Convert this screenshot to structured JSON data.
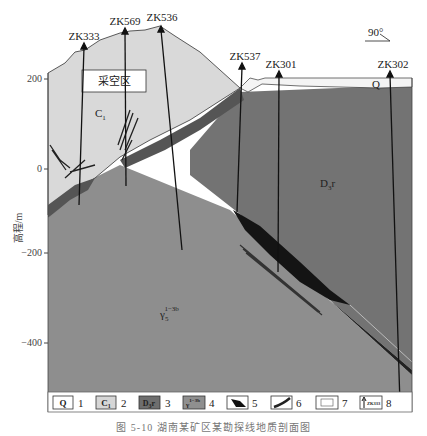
{
  "figure": {
    "caption": "图 5-10  湖南某矿区某勘探线地质剖面图",
    "orientation_label": "90°",
    "y_axis": {
      "label": "高程/m",
      "ticks": [
        "200",
        "0",
        "−200",
        "−400"
      ]
    },
    "boreholes": [
      {
        "id": "ZK333"
      },
      {
        "id": "ZK569"
      },
      {
        "id": "ZK536"
      },
      {
        "id": "ZK537"
      },
      {
        "id": "ZK301"
      },
      {
        "id": "ZK302"
      }
    ],
    "area_labels": {
      "mined_out": "采空区",
      "c1": "C",
      "c1_sub": "1",
      "d3r": "D",
      "d3r_sub": "3",
      "d3r_suffix": "r",
      "q": "Q",
      "granite": "γ",
      "granite_sub": "5",
      "granite_sup": "1−3b"
    },
    "legend": [
      {
        "num": "1",
        "symbol": "Q",
        "meaning": "Quaternary",
        "fill": "#ffffff"
      },
      {
        "num": "2",
        "symbol": "C1",
        "meaning": "Lower Carboniferous",
        "fill": "#d6d6d6"
      },
      {
        "num": "3",
        "symbol": "D3r",
        "meaning": "Upper Devonian",
        "fill": "#6e6e6e"
      },
      {
        "num": "4",
        "symbol": "γ5 1−3b",
        "meaning": "Granite",
        "fill": "#8f8f8f"
      },
      {
        "num": "5",
        "symbol": "orebody",
        "meaning": "Ore body",
        "fill": "#111111"
      },
      {
        "num": "6",
        "symbol": "vein",
        "meaning": "Vein",
        "fill": "#333333"
      },
      {
        "num": "7",
        "symbol": "blank",
        "meaning": "Mined-out area",
        "fill": "#ffffff"
      },
      {
        "num": "8",
        "symbol": "ZK333",
        "meaning": "Borehole",
        "fill": "#ffffff"
      }
    ],
    "colors": {
      "q": "#f4f4f4",
      "c1": "#d9d9d9",
      "d3r": "#737373",
      "granite": "#8e8e8e",
      "ore": "#141414",
      "band": "#555555"
    }
  }
}
